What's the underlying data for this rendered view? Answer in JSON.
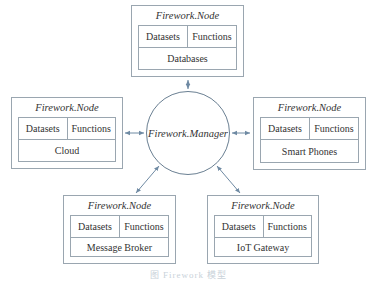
{
  "diagram": {
    "manager": {
      "label": "Firework.Manager"
    },
    "nodes": [
      {
        "id": "databases",
        "title": "Firework.Node",
        "left_cell": "Datasets",
        "right_cell": "Functions",
        "label": "Databases"
      },
      {
        "id": "cloud",
        "title": "Firework.Node",
        "left_cell": "Datasets",
        "right_cell": "Functions",
        "label": "Cloud"
      },
      {
        "id": "smart-phones",
        "title": "Firework.Node",
        "left_cell": "Datasets",
        "right_cell": "Functions",
        "label": "Smart Phones"
      },
      {
        "id": "message-broker",
        "title": "Firework.Node",
        "left_cell": "Datasets",
        "right_cell": "Functions",
        "label": "Message Broker"
      },
      {
        "id": "iot-gateway",
        "title": "Firework.Node",
        "left_cell": "Datasets",
        "right_cell": "Functions",
        "label": "IoT Gateway"
      }
    ],
    "edges": [
      {
        "from": "manager",
        "to": "databases",
        "type": "bidirectional-arrow"
      },
      {
        "from": "manager",
        "to": "cloud",
        "type": "bidirectional-arrow"
      },
      {
        "from": "manager",
        "to": "smart-phones",
        "type": "bidirectional-arrow"
      },
      {
        "from": "manager",
        "to": "message-broker",
        "type": "bidirectional-arrow"
      },
      {
        "from": "manager",
        "to": "iot-gateway",
        "type": "bidirectional-arrow"
      }
    ],
    "colors": {
      "arrow": "#6f8aa3",
      "border": "#9aa6b0",
      "circle": "#6a7f92",
      "text": "#333333"
    },
    "caption": "图  Firework 模型"
  }
}
